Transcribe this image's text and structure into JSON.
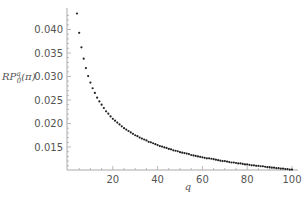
{
  "chart_data": {
    "type": "scatter",
    "title": "",
    "xlabel": "q",
    "ylabel": "RP^q_0(π)",
    "ylabel_parts": {
      "base": "RP",
      "sup": "q",
      "sub": "0",
      "arg": "(π)"
    },
    "xlim": [
      0,
      100
    ],
    "ylim": [
      0.0099,
      0.044
    ],
    "x_ticks": [
      20,
      40,
      60,
      80,
      100
    ],
    "y_ticks": [
      0.015,
      0.02,
      0.025,
      0.03,
      0.035,
      0.04
    ],
    "y_tick_labels": [
      "0.015",
      "0.020",
      "0.025",
      "0.030",
      "0.035",
      "0.040"
    ],
    "grid": false,
    "legend": null,
    "marker_color": "#222222",
    "axis_color": "#aaaaaa",
    "series": [
      {
        "name": "RP^q_0(π)",
        "x": [
          4,
          5,
          6,
          7,
          8,
          9,
          10,
          11,
          12,
          13,
          14,
          15,
          16,
          17,
          18,
          19,
          20,
          21,
          22,
          23,
          24,
          25,
          26,
          27,
          28,
          29,
          30,
          31,
          32,
          33,
          34,
          35,
          36,
          37,
          38,
          39,
          40,
          41,
          42,
          43,
          44,
          45,
          46,
          47,
          48,
          49,
          50,
          51,
          52,
          53,
          54,
          55,
          56,
          57,
          58,
          59,
          60,
          61,
          62,
          63,
          64,
          65,
          66,
          67,
          68,
          69,
          70,
          71,
          72,
          73,
          74,
          75,
          76,
          77,
          78,
          79,
          80,
          81,
          82,
          83,
          84,
          85,
          86,
          87,
          88,
          89,
          90,
          91,
          92,
          93,
          94,
          95,
          96,
          97,
          98,
          99,
          100
        ],
        "y": [
          0.0434,
          0.0393,
          0.0362,
          0.0338,
          0.0318,
          0.0301,
          0.0287,
          0.0275,
          0.0265,
          0.0255,
          0.0247,
          0.024,
          0.0233,
          0.0226,
          0.0221,
          0.0215,
          0.021,
          0.0206,
          0.0202,
          0.0198,
          0.0194,
          0.019,
          0.0187,
          0.0184,
          0.0181,
          0.0178,
          0.0175,
          0.0173,
          0.017,
          0.0168,
          0.0166,
          0.0164,
          0.0161,
          0.016,
          0.0158,
          0.0156,
          0.0154,
          0.0152,
          0.0151,
          0.0149,
          0.0148,
          0.0146,
          0.0145,
          0.0143,
          0.0142,
          0.0141,
          0.0139,
          0.0138,
          0.0137,
          0.0136,
          0.0135,
          0.0133,
          0.0132,
          0.0131,
          0.013,
          0.0129,
          0.0128,
          0.0127,
          0.0126,
          0.0126,
          0.0125,
          0.0124,
          0.0123,
          0.0122,
          0.0121,
          0.012,
          0.012,
          0.0119,
          0.0118,
          0.0117,
          0.0117,
          0.0116,
          0.0115,
          0.0115,
          0.0114,
          0.0113,
          0.0113,
          0.0112,
          0.0111,
          0.0111,
          0.011,
          0.011,
          0.0109,
          0.0109,
          0.0108,
          0.0107,
          0.0107,
          0.0106,
          0.0106,
          0.0105,
          0.0105,
          0.0104,
          0.0104,
          0.0103,
          0.0103,
          0.0102,
          0.0102
        ]
      }
    ]
  },
  "labels": {
    "ylabel_base": "RP",
    "ylabel_sup": "q",
    "ylabel_sub": "0",
    "ylabel_arg": "(π)",
    "xlabel": "q"
  }
}
